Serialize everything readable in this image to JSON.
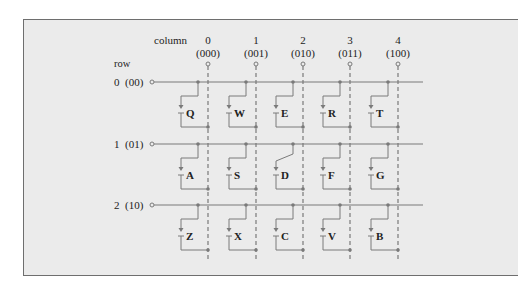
{
  "figure": {
    "column_header": "column",
    "row_header": "row",
    "columns": [
      {
        "index": "0",
        "code": "(000)",
        "x": 208
      },
      {
        "index": "1",
        "code": "(001)",
        "x": 256
      },
      {
        "index": "2",
        "code": "(010)",
        "x": 303
      },
      {
        "index": "3",
        "code": "(011)",
        "x": 350
      },
      {
        "index": "4",
        "code": "(100)",
        "x": 398
      }
    ],
    "rows": [
      {
        "label": "0  (00)",
        "y": 82,
        "keys": [
          "Q",
          "W",
          "E",
          "R",
          "T"
        ]
      },
      {
        "label": "1  (01)",
        "y": 144,
        "keys": [
          "A",
          "S",
          "D",
          "F",
          "G"
        ]
      },
      {
        "label": "2  (10)",
        "y": 205,
        "keys": [
          "Z",
          "X",
          "C",
          "V",
          "B"
        ]
      }
    ],
    "pressed_key": "D",
    "colors": {
      "panel_bg": "#ebebeb",
      "panel_border": "#6e6e6e",
      "wire": "#7a7a7a",
      "dot": "#7a7a7a",
      "text": "#222222"
    }
  }
}
